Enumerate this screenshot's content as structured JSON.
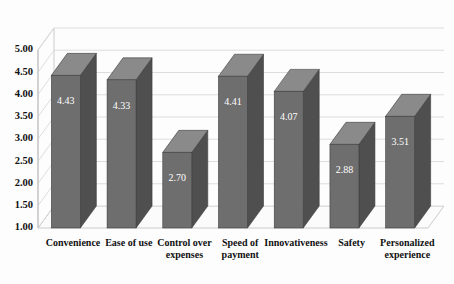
{
  "chart_data": {
    "type": "bar",
    "title": "",
    "subtitle": "",
    "xlabel": "",
    "ylabel": "",
    "ylim": [
      1.0,
      5.0
    ],
    "grid": true,
    "legend": "none",
    "three_d": true,
    "categories": [
      "Convenience",
      "Ease of use",
      "Control over expenses",
      "Speed of payment",
      "Innovativeness",
      "Safety",
      "Personalized experience"
    ],
    "category_lines": [
      [
        "Convenience"
      ],
      [
        "Ease of use"
      ],
      [
        "Control over",
        "expenses"
      ],
      [
        "Speed of",
        "payment"
      ],
      [
        "Innovativeness"
      ],
      [
        "Safety"
      ],
      [
        "Personalized",
        "experience"
      ]
    ],
    "values": [
      4.43,
      4.33,
      2.7,
      4.41,
      4.07,
      2.88,
      3.51
    ],
    "value_labels": [
      "4.43",
      "4.33",
      "2.70",
      "4.41",
      "4.07",
      "2.88",
      "3.51"
    ],
    "yticks": [
      1.0,
      1.5,
      2.0,
      2.5,
      3.0,
      3.5,
      4.0,
      4.5,
      5.0
    ],
    "ytick_labels": [
      "1.00",
      "1.50",
      "2.00",
      "2.50",
      "3.00",
      "3.50",
      "4.00",
      "4.50",
      "5.00"
    ],
    "colors": {
      "bar_front": "#6e6e6e",
      "bar_side": "#4f4f4f",
      "bar_top": "#8a8a8a",
      "bar_edge": "#3d3d3d",
      "grid": "#d9d9d9",
      "floor": "#fbfbfb",
      "axis": "#bfbfbf",
      "background": "#fdfdfd",
      "value_label": "#ffffff",
      "tick_label": "#111111"
    }
  }
}
